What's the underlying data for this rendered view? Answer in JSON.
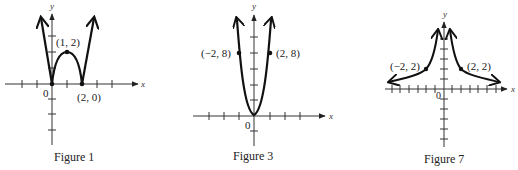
{
  "figures": [
    {
      "id": "figure1",
      "caption": "Figure 1",
      "axis_labels": {
        "x": "x",
        "y": "y"
      },
      "origin_label": "0",
      "points": [
        {
          "label": "(1, 2)",
          "x": 1,
          "y": 2
        },
        {
          "label": "(2, 0)",
          "x": 2,
          "y": 0
        },
        {
          "label": "",
          "x": 0,
          "y": 0
        }
      ],
      "curve": "W-shaped: |x(x-2)|-like absolute-value quadratic, arrows up on both ends"
    },
    {
      "id": "figure3",
      "caption": "Figure 3",
      "axis_labels": {
        "x": "x",
        "y": "y"
      },
      "origin_label": "0",
      "points": [
        {
          "label": "(−2, 8)",
          "x": -2,
          "y": 8
        },
        {
          "label": "(2, 8)",
          "x": 2,
          "y": 8
        }
      ],
      "curve": "Parabola-like (quartic) opening upward through origin, arrows up on both ends"
    },
    {
      "id": "figure7",
      "caption": "Figure 7",
      "axis_labels": {
        "x": "x",
        "y": "y"
      },
      "origin_label": "0",
      "points": [
        {
          "label": "(−2, 2)",
          "x": -2,
          "y": 2
        },
        {
          "label": "(2, 2)",
          "x": 2,
          "y": 2
        }
      ],
      "curve": "Reciprocal |1/x|-type curve, symmetric about y-axis, arrows toward axes"
    }
  ]
}
